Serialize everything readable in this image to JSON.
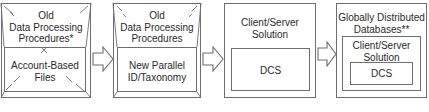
{
  "stages": [
    {
      "title_lines": [
        "Old",
        "Data Processing",
        "Procedures*"
      ],
      "inner": {
        "lines": [
          "Account-Based",
          "Files"
        ]
      },
      "crossed_out": true
    },
    {
      "title_lines": [
        "Old",
        "Data Processing",
        "Procedures"
      ],
      "inner": {
        "lines": [
          "New Parallel",
          "ID/Taxonomy"
        ]
      },
      "crossed_out": "partial"
    },
    {
      "title_lines": [
        "Client/Server",
        "Solution"
      ],
      "inner": {
        "lines": [
          "DCS"
        ]
      },
      "crossed_out": false
    },
    {
      "title_lines": [
        "Globally Distributed",
        "Databases**"
      ],
      "middle": {
        "lines": [
          "Client/Server",
          "Solution"
        ]
      },
      "inner": {
        "lines": [
          "DCS"
        ]
      },
      "crossed_out": false
    }
  ],
  "arrows": [
    {
      "from": 0,
      "to": 1,
      "icon": "right-block-arrow-icon"
    },
    {
      "from": 1,
      "to": 2,
      "icon": "right-block-arrow-icon"
    },
    {
      "from": 2,
      "to": 3,
      "icon": "right-block-arrow-icon"
    }
  ],
  "colors": {
    "line": "#6e6e6e",
    "text": "#2a2a2a",
    "background": "#ffffff"
  }
}
